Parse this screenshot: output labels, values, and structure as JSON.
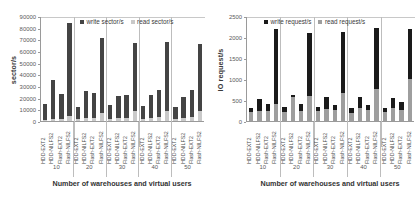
{
  "figure": {
    "panels": [
      "sector-throughput-chart",
      "io-request-chart"
    ]
  },
  "chart_data": [
    {
      "id": "sector-throughput-chart",
      "type": "bar",
      "stacked": true,
      "title": "",
      "xlabel": "Number of warehouses and virtual users",
      "ylabel": "sector/s",
      "ylim": [
        0,
        90000
      ],
      "yticks": [
        0,
        10000,
        20000,
        30000,
        40000,
        50000,
        60000,
        70000,
        80000,
        90000
      ],
      "ytick_labels": [
        "0",
        "10000",
        "20000",
        "30000",
        "40000",
        "50000",
        "60000",
        "70000",
        "80000",
        "90000"
      ],
      "grid": false,
      "legend_position": "top-center",
      "legend": [
        "write sector/s",
        "read sector/s"
      ],
      "group_labels": [
        "10",
        "20",
        "30",
        "40",
        "50"
      ],
      "categories": [
        "HDD-EXT2",
        "HDD-NILFS2",
        "Flash-EXT2",
        "Flash-NILFS2"
      ],
      "colors": {
        "write": "#444444",
        "read": "#c9c9c9"
      },
      "series": [
        {
          "name": "read sector/s",
          "values": [
            [
              1200,
              1400,
              1500,
              4200
            ],
            [
              1500,
              2200,
              2400,
              6800
            ],
            [
              1800,
              2700,
              3000,
              8200
            ],
            [
              1900,
              2900,
              3200,
              8600
            ],
            [
              2000,
              3000,
              3400,
              8800
            ]
          ]
        },
        {
          "name": "write sector/s",
          "values": [
            [
              13800,
              33600,
              21800,
              79800
            ],
            [
              10300,
              23200,
              21200,
              64700
            ],
            [
              11600,
              18600,
              19700,
              58300
            ],
            [
              11300,
              19700,
              23300,
              59400
            ],
            [
              9700,
              17800,
              23200,
              57000
            ]
          ]
        }
      ],
      "totals": [
        [
          15000,
          35000,
          23300,
          84000
        ],
        [
          11800,
          25400,
          23600,
          71500
        ],
        [
          13400,
          21300,
          22700,
          66500
        ],
        [
          13200,
          22600,
          26500,
          68000
        ],
        [
          11700,
          20800,
          26600,
          65800
        ]
      ]
    },
    {
      "id": "io-request-chart",
      "type": "bar",
      "stacked": true,
      "title": "",
      "xlabel": "Number of warehouses and virtual users",
      "ylabel": "IO request/s",
      "ylim": [
        0,
        2500
      ],
      "yticks": [
        0,
        500,
        1000,
        1500,
        2000,
        2500
      ],
      "ytick_labels": [
        "0",
        "500",
        "1000",
        "1500",
        "2000",
        "2500"
      ],
      "grid": false,
      "legend_position": "top-center",
      "legend": [
        "write request/s",
        "read request/s"
      ],
      "group_labels": [
        "10",
        "20",
        "30",
        "40",
        "50"
      ],
      "categories": [
        "HDD-EXT2",
        "HDD-NILFS2",
        "Flash-EXT2",
        "Flash-NILFS2"
      ],
      "colors": {
        "write": "#1a1a1a",
        "read": "#9e9e9e"
      },
      "series": [
        {
          "name": "read request/s",
          "values": [
            [
              215,
              250,
              245,
              405
            ],
            [
              225,
              580,
              250,
              585
            ],
            [
              235,
              290,
              260,
              675
            ],
            [
              195,
              300,
              265,
              760
            ],
            [
              205,
              300,
              265,
              1000
            ]
          ]
        },
        {
          "name": "write request/s",
          "values": [
            [
              90,
              275,
              160,
              1780
            ],
            [
              115,
              35,
              155,
              1505
            ],
            [
              100,
              290,
              125,
              1445
            ],
            [
              125,
              265,
              110,
              1445
            ],
            [
              115,
              250,
              195,
              1180
            ]
          ]
        }
      ],
      "totals": [
        [
          305,
          525,
          405,
          2185
        ],
        [
          340,
          615,
          405,
          2090
        ],
        [
          335,
          580,
          385,
          2120
        ],
        [
          320,
          565,
          375,
          2205
        ],
        [
          320,
          550,
          460,
          2180
        ]
      ]
    }
  ]
}
